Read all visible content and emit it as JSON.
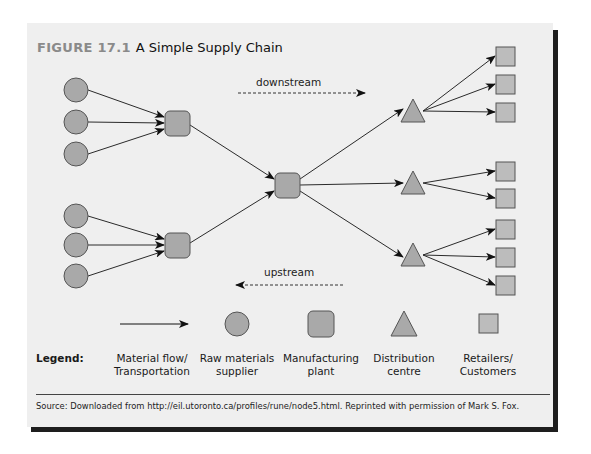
{
  "figure": {
    "number_label": "FIGURE 17.1",
    "title": "A Simple Supply Chain"
  },
  "flow_labels": {
    "downstream": "downstream",
    "upstream": "upstream"
  },
  "nodes": {
    "suppliers": [
      {
        "id": "s1",
        "group": 1
      },
      {
        "id": "s2",
        "group": 1
      },
      {
        "id": "s3",
        "group": 1
      },
      {
        "id": "s4",
        "group": 2
      },
      {
        "id": "s5",
        "group": 2
      },
      {
        "id": "s6",
        "group": 2
      }
    ],
    "plants": [
      {
        "id": "p1",
        "receives_from": [
          "s1",
          "s2",
          "s3"
        ]
      },
      {
        "id": "p2",
        "receives_from": [
          "s4",
          "s5",
          "s6"
        ]
      },
      {
        "id": "p3",
        "receives_from": [
          "p1",
          "p2"
        ]
      }
    ],
    "distribution_centres": [
      {
        "id": "d1",
        "receives_from": "p3",
        "serves": 3
      },
      {
        "id": "d2",
        "receives_from": "p3",
        "serves": 2
      },
      {
        "id": "d3",
        "receives_from": "p3",
        "serves": 3
      }
    ],
    "retailer_count": 8
  },
  "legend": {
    "heading": "Legend:",
    "items": [
      {
        "symbol": "arrow",
        "line1": "Material flow/",
        "line2": "Transportation"
      },
      {
        "symbol": "circle",
        "line1": "Raw materials",
        "line2": "supplier"
      },
      {
        "symbol": "rounded-square",
        "line1": "Manufacturing",
        "line2": "plant"
      },
      {
        "symbol": "triangle",
        "line1": "Distribution",
        "line2": "centre"
      },
      {
        "symbol": "square",
        "line1": "Retailers/",
        "line2": "Customers"
      }
    ]
  },
  "source": "Source: Downloaded from http://eil.utoronto.ca/profiles/rune/node5.html. Reprinted with permission of Mark S. Fox.",
  "colors": {
    "node_fill": "#a9a9a9",
    "retailer_fill": "#bcbcbc",
    "stroke": "#555555",
    "panel_bg": "#efefef"
  }
}
